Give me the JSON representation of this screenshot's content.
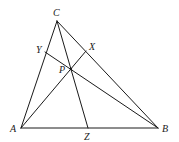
{
  "figure": {
    "points": {
      "A": {
        "x": 21,
        "y": 128
      },
      "B": {
        "x": 158,
        "y": 128
      },
      "C": {
        "x": 57,
        "y": 21
      },
      "X": {
        "x": 86,
        "y": 51
      },
      "Y": {
        "x": 45,
        "y": 52
      },
      "Z": {
        "x": 88,
        "y": 128
      },
      "P": {
        "x": 71,
        "y": 69
      }
    },
    "labels": {
      "A": "A",
      "B": "B",
      "C": "C",
      "X": "X",
      "Y": "Y",
      "Z": "Z",
      "P": "P"
    },
    "segments": [
      [
        "A",
        "B"
      ],
      [
        "B",
        "C"
      ],
      [
        "C",
        "A"
      ],
      [
        "A",
        "X"
      ],
      [
        "B",
        "Y"
      ],
      [
        "C",
        "Z"
      ]
    ],
    "colors": {
      "stroke": "#1a1a1a",
      "background": "#ffffff"
    }
  }
}
